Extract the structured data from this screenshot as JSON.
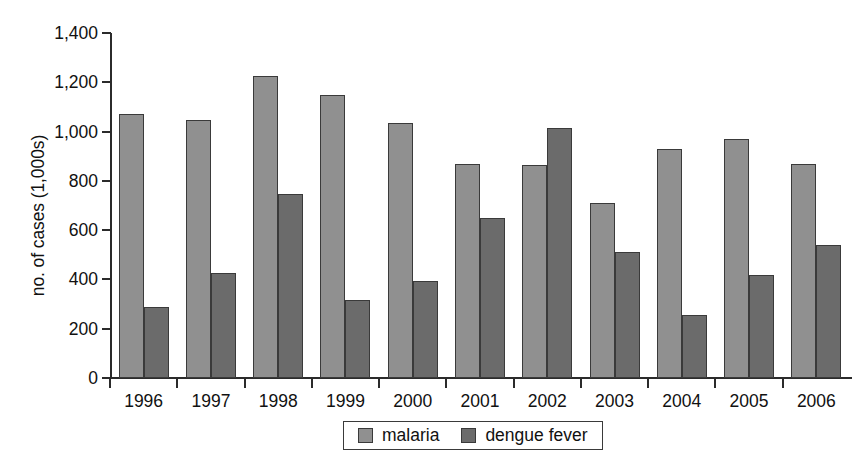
{
  "chart_data": {
    "type": "bar",
    "title": "",
    "subtitle": "",
    "xlabel": "",
    "ylabel": "no. of cases (1,000s)",
    "categories": [
      "1996",
      "1997",
      "1998",
      "1999",
      "2000",
      "2001",
      "2002",
      "2003",
      "2004",
      "2005",
      "2006"
    ],
    "series": [
      {
        "name": "malaria",
        "color": "#909090",
        "values": [
          1070,
          1045,
          1225,
          1150,
          1035,
          870,
          865,
          710,
          930,
          970,
          870
        ]
      },
      {
        "name": "dengue fever",
        "color": "#6b6b6b",
        "values": [
          290,
          425,
          745,
          315,
          395,
          650,
          1015,
          510,
          255,
          420,
          540
        ]
      }
    ],
    "ylim": [
      0,
      1400
    ],
    "ytick_values": [
      0,
      200,
      400,
      600,
      800,
      1000,
      1200,
      1400
    ],
    "ytick_labels": [
      "0",
      "200",
      "400",
      "600",
      "800",
      "1,000",
      "1,200",
      "1,400"
    ],
    "grid": false,
    "legend_position": "bottom"
  },
  "legend": {
    "entries": [
      {
        "label": "malaria",
        "color": "#909090"
      },
      {
        "label": "dengue fever",
        "color": "#6b6b6b"
      }
    ]
  },
  "colors": {
    "malaria": "#909090",
    "dengue_fever": "#6b6b6b",
    "axis": "#2b2b2b",
    "background": "#ffffff",
    "text": "#111111"
  }
}
